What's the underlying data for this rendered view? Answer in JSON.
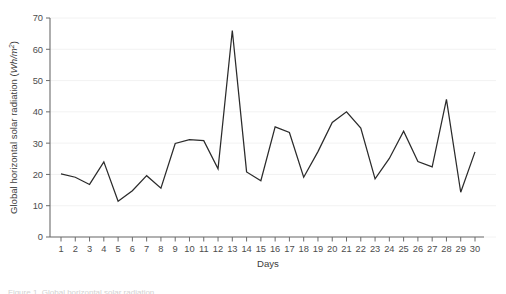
{
  "figure": {
    "background_color": "#ffffff",
    "line_color": "#2b2b2b",
    "grid_color": "#f0f0f0",
    "axis_color": "#6b6b6b",
    "tick_text_color": "#4d4d4d",
    "caption_partial": "Figure 1. Global horizontal solar radiation"
  },
  "chart_data": {
    "type": "line",
    "title": "",
    "xlabel": "Days",
    "ylabel": "Global horizontal solar radiation (Wh/m2)",
    "ylabel_main": "Global horizontal solar radiation (",
    "ylabel_unit_num": "Wh/m",
    "ylabel_unit_exp": "2",
    "ylabel_close": ")",
    "xlim": [
      1,
      30
    ],
    "ylim": [
      0,
      70
    ],
    "yticks": [
      0,
      10,
      20,
      30,
      40,
      50,
      60,
      70
    ],
    "ytick_labels": [
      "0",
      "10",
      "20",
      "30",
      "40",
      "50",
      "60",
      "70"
    ],
    "xticks": [
      1,
      2,
      3,
      4,
      5,
      6,
      7,
      8,
      9,
      10,
      11,
      12,
      13,
      14,
      15,
      16,
      17,
      18,
      19,
      20,
      21,
      22,
      23,
      24,
      25,
      26,
      27,
      28,
      29,
      30
    ],
    "xtick_labels": [
      "1",
      "2",
      "3",
      "4",
      "5",
      "6",
      "7",
      "8",
      "9",
      "10",
      "11",
      "12",
      "13",
      "14",
      "15",
      "16",
      "17",
      "18",
      "19",
      "20",
      "21",
      "22",
      "23",
      "24",
      "25",
      "26",
      "27",
      "28",
      "29",
      "30"
    ],
    "grid": true,
    "grid_axis": "y",
    "legend": false,
    "categories": [
      1,
      2,
      3,
      4,
      5,
      6,
      7,
      8,
      9,
      10,
      11,
      12,
      13,
      14,
      15,
      16,
      17,
      18,
      19,
      20,
      21,
      22,
      23,
      24,
      25,
      26,
      27,
      28,
      29,
      30
    ],
    "values": [
      20.2,
      19.1,
      16.8,
      24.0,
      11.4,
      14.8,
      19.6,
      15.6,
      29.9,
      31.1,
      30.8,
      21.8,
      66.0,
      20.8,
      18.0,
      35.2,
      33.4,
      19.1,
      27.3,
      36.6,
      40.0,
      34.8,
      18.6,
      25.1,
      33.8,
      24.1,
      22.4,
      44.0,
      14.3,
      27.2
    ],
    "series": [
      {
        "name": "Global horizontal solar radiation",
        "values": [
          20.2,
          19.1,
          16.8,
          24.0,
          11.4,
          14.8,
          19.6,
          15.6,
          29.9,
          31.1,
          30.8,
          21.8,
          66.0,
          20.8,
          18.0,
          35.2,
          33.4,
          19.1,
          27.3,
          36.6,
          40.0,
          34.8,
          18.6,
          25.1,
          33.8,
          24.1,
          22.4,
          44.0,
          14.3,
          27.2
        ]
      }
    ],
    "max_value": 66.0,
    "max_day": 13,
    "min_value": 11.4,
    "min_day": 5
  }
}
